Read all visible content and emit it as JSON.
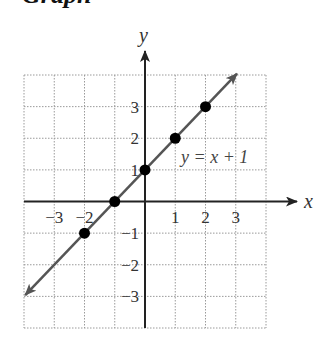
{
  "heading": "Graph",
  "chart_data": {
    "type": "line",
    "title": "",
    "xlabel": "x",
    "ylabel": "y",
    "xlim": [
      -4,
      4
    ],
    "ylim": [
      -4,
      4
    ],
    "grid": true,
    "grid_style": "dotted",
    "x_ticks": [
      -3,
      -2,
      1,
      2,
      3
    ],
    "x_tick_labels": [
      "−3",
      "−2",
      "1",
      "2",
      "3"
    ],
    "y_ticks": [
      3,
      2,
      1,
      -1,
      -2,
      -3
    ],
    "y_tick_labels": [
      "3",
      "2",
      "1",
      "−1",
      "−2",
      "−3"
    ],
    "series": [
      {
        "name": "y = x + 1",
        "equation": "y = x + 1",
        "line_x": [
          -3.96,
          3.04
        ],
        "line_y": [
          -2.96,
          4.04
        ],
        "arrows_both_ends": true,
        "points": [
          {
            "x": -2,
            "y": -1
          },
          {
            "x": -1,
            "y": 0
          },
          {
            "x": 0,
            "y": 1
          },
          {
            "x": 1,
            "y": 2
          },
          {
            "x": 2,
            "y": 3
          }
        ]
      }
    ],
    "annotations": [
      {
        "text": "y = x + 1",
        "x": 1.2,
        "y": 1.2
      }
    ]
  },
  "labels": {
    "x_axis": "x",
    "y_axis": "y",
    "equation": "y = x + 1"
  },
  "colors": {
    "axis": "#222222",
    "line": "#555555",
    "point": "#000000",
    "grid": "#9a9a9a",
    "text": "#333333"
  }
}
